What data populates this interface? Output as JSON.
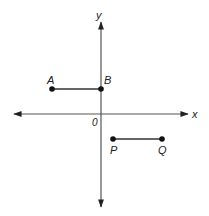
{
  "diagram": {
    "type": "coordinate-plane",
    "axes": {
      "x_label": "x",
      "y_label": "y",
      "origin_label": "0"
    },
    "points": [
      {
        "name": "A",
        "label": "A",
        "quadrant": "II"
      },
      {
        "name": "B",
        "label": "B",
        "location": "on positive y-axis"
      },
      {
        "name": "P",
        "label": "P",
        "quadrant": "IV"
      },
      {
        "name": "Q",
        "label": "Q",
        "quadrant": "IV"
      }
    ],
    "segments": [
      {
        "from": "A",
        "to": "B"
      },
      {
        "from": "P",
        "to": "Q"
      }
    ],
    "colors": {
      "ink": "#222222",
      "background": "#ffffff"
    }
  }
}
